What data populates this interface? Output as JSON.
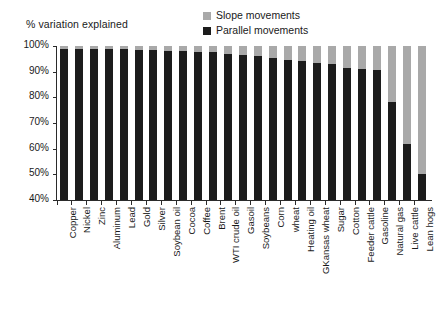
{
  "chart_data": {
    "type": "bar",
    "stacked": true,
    "title": "% variation explained",
    "xlabel": "",
    "ylabel": "",
    "ylim": [
      40,
      100
    ],
    "ytick_labels": [
      "100%",
      "90%",
      "80%",
      "70%",
      "60%",
      "50%",
      "40%"
    ],
    "ytick_values": [
      100,
      90,
      80,
      70,
      60,
      50,
      40
    ],
    "grid": false,
    "legend_position": "top-center",
    "categories": [
      "Copper",
      "Nickel",
      "Zinc",
      "Aluminum",
      "Lead",
      "Gold",
      "Silver",
      "Soybean oil",
      "Cocoa",
      "Coffee",
      "Brent",
      "WTI crude oil",
      "Gasoil",
      "Soybeans",
      "Corn",
      "wheat",
      "Heating oil",
      "GKansas wheat",
      "Sugar",
      "Cotton",
      "Feeder cattle",
      "Gasoline",
      "Natural gas",
      "Live cattle",
      "Lean hogs"
    ],
    "series": [
      {
        "name": "Parallel movements",
        "color": "#1c1c1c",
        "values": [
          99,
          99,
          99,
          99,
          99,
          98.5,
          98.5,
          98,
          98,
          97.5,
          97.5,
          97,
          96.5,
          96,
          95.5,
          94.5,
          94,
          93.5,
          93,
          91.5,
          91,
          90.5,
          78,
          62,
          50
        ]
      },
      {
        "name": "Slope movements",
        "color": "#a9a9a9",
        "values": [
          1,
          1,
          1,
          1,
          1,
          1.5,
          1.5,
          2,
          2,
          2.5,
          2.5,
          3,
          3.5,
          4,
          4.5,
          5.5,
          6,
          6.5,
          7,
          8.5,
          9,
          9.5,
          22,
          38,
          50
        ]
      }
    ]
  },
  "legend": {
    "items": [
      {
        "label": "Slope movements",
        "color": "#a9a9a9"
      },
      {
        "label": "Parallel movements",
        "color": "#1c1c1c"
      }
    ]
  }
}
